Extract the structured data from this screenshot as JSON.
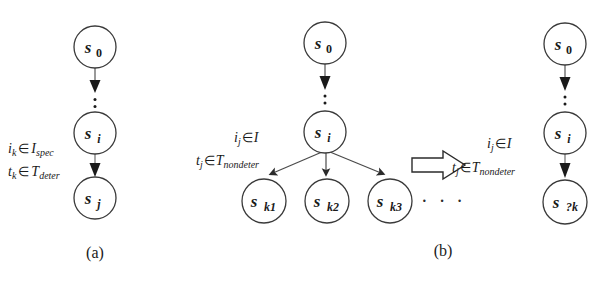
{
  "figure": {
    "background": "#ffffff",
    "stroke_color": "#2b2b2b",
    "text_color": "#1a1a1a",
    "width": 616,
    "height": 293
  },
  "panel_a": {
    "caption": "(a)",
    "nodes": [
      {
        "name": "s0",
        "base": "s",
        "sub": "0",
        "sub_italic": false,
        "cx": 95,
        "cy": 47,
        "r": 21
      },
      {
        "name": "si",
        "base": "s",
        "sub": "i",
        "sub_italic": true,
        "cx": 95,
        "cy": 133,
        "r": 21
      },
      {
        "name": "sj",
        "base": "s",
        "sub": "j",
        "sub_italic": true,
        "cx": 95,
        "cy": 198,
        "r": 21
      }
    ],
    "edges": [
      {
        "name": "s0-to-si",
        "style": "dotted-with-arrowhead"
      },
      {
        "name": "si-to-sj",
        "style": "solid-with-arrowhead"
      }
    ],
    "labels": [
      {
        "name": "input-condition",
        "var": "i",
        "var_sub": "k",
        "op": "∈",
        "set": "I",
        "set_sub": "spec",
        "x": 8,
        "y": 153
      },
      {
        "name": "time-condition",
        "var": "t",
        "var_sub": "k",
        "op": "∈",
        "set": "T",
        "set_sub": "deter",
        "x": 8,
        "y": 176
      }
    ]
  },
  "panel_b": {
    "caption": "(b)",
    "left_nodes": [
      {
        "name": "s0",
        "base": "s",
        "sub": "0",
        "sub_italic": false,
        "cx": 325,
        "cy": 43,
        "r": 21
      },
      {
        "name": "si",
        "base": "s",
        "sub": "i",
        "sub_italic": true,
        "cx": 325,
        "cy": 132,
        "r": 21
      },
      {
        "name": "sk1",
        "base": "s",
        "sub": "k1",
        "sub_italic": true,
        "cx": 264,
        "cy": 201,
        "r": 22
      },
      {
        "name": "sk2",
        "base": "s",
        "sub": "k2",
        "sub_italic": true,
        "cx": 327,
        "cy": 201,
        "r": 22
      },
      {
        "name": "sk3",
        "base": "s",
        "sub": "k3",
        "sub_italic": true,
        "cx": 390,
        "cy": 201,
        "r": 22
      }
    ],
    "left_labels": [
      {
        "name": "input-condition-left",
        "var": "i",
        "var_sub": "j",
        "op": "∈",
        "set": "I",
        "set_sub": "",
        "x": 234,
        "y": 142
      },
      {
        "name": "time-condition-left",
        "var": "t",
        "var_sub": "j",
        "op": "∈",
        "set": "T",
        "set_sub": "nondeter",
        "x": 196,
        "y": 165
      }
    ],
    "ellipsis": "· · ·",
    "transform_arrow": {
      "name": "implies-arrow",
      "glyph": "⇒"
    },
    "right_nodes": [
      {
        "name": "s0",
        "base": "s",
        "sub": "0",
        "sub_italic": false,
        "cx": 565,
        "cy": 44,
        "r": 21
      },
      {
        "name": "si",
        "base": "s",
        "sub": "i",
        "sub_italic": true,
        "cx": 565,
        "cy": 133,
        "r": 21
      },
      {
        "name": "sqk",
        "base": "s",
        "sub": "?k",
        "sub_italic": true,
        "cx": 565,
        "cy": 202,
        "r": 22
      }
    ],
    "right_labels": [
      {
        "name": "input-condition-right",
        "var": "i",
        "var_sub": "j",
        "op": "∈",
        "set": "I",
        "set_sub": "",
        "x": 487,
        "y": 148
      },
      {
        "name": "time-condition-right",
        "var": "t",
        "var_sub": "j",
        "op": "∈",
        "set": "T",
        "set_sub": "nondeter",
        "x": 452,
        "y": 172
      }
    ]
  }
}
